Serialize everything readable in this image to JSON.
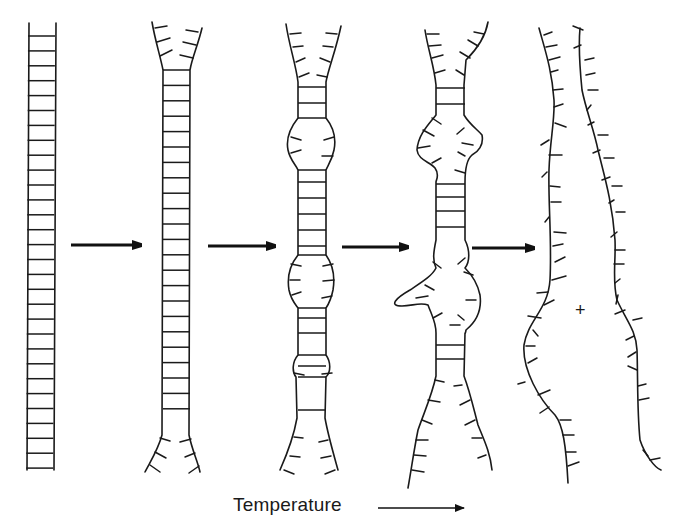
{
  "figure": {
    "stroke_color": "#1a1a1a",
    "stages": [
      {
        "id": 1,
        "name": "intact double helix",
        "rungs": 30
      },
      {
        "id": 2,
        "name": "ends fraying"
      },
      {
        "id": 3,
        "name": "small internal bubbles"
      },
      {
        "id": 4,
        "name": "large melted regions"
      },
      {
        "id": 5,
        "name": "fully separated single strands"
      }
    ],
    "arrows_between_stages": 4,
    "center_mark": "+",
    "axis_label": "Temperature"
  }
}
